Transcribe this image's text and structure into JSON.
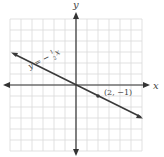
{
  "chart_data": {
    "type": "line",
    "title": "",
    "xlabel": "x",
    "ylabel": "y",
    "xlim": [
      -6,
      6
    ],
    "ylim": [
      -6,
      6
    ],
    "grid": true,
    "series": [
      {
        "name": "y = -1/2 x",
        "slope": -0.5,
        "intercept": 0,
        "x": [
          -6,
          6
        ],
        "y": [
          3,
          -3
        ]
      }
    ],
    "points": [
      {
        "x": 2,
        "y": -1,
        "label": "(2, −1)"
      }
    ],
    "annotations": [
      "y = −½x",
      "(2, −1)"
    ]
  },
  "labels": {
    "x_axis": "x",
    "y_axis": "y",
    "equation": "y = −",
    "frac_num": "1",
    "frac_den": "2",
    "equation_var": "x",
    "point": "(2, −1)"
  },
  "colors": {
    "grid": "#d9d9d9",
    "axis": "#333333",
    "line": "#3a3a3a"
  }
}
